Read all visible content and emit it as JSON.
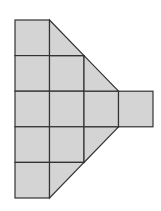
{
  "diagram": {
    "fill_color": "#d4d4d4",
    "stroke_color": "#333333",
    "background": "#ffffff",
    "grid": {
      "x": [
        15,
        49.5,
        84,
        118.5,
        153
      ],
      "y": [
        20,
        55.6,
        91.2,
        126.8,
        162.4,
        198
      ]
    },
    "full_squares": [
      {
        "col": 0,
        "row": 0
      },
      {
        "col": 0,
        "row": 1
      },
      {
        "col": 0,
        "row": 2
      },
      {
        "col": 0,
        "row": 3
      },
      {
        "col": 0,
        "row": 4
      },
      {
        "col": 1,
        "row": 1
      },
      {
        "col": 1,
        "row": 2
      },
      {
        "col": 1,
        "row": 3
      },
      {
        "col": 2,
        "row": 2
      },
      {
        "col": 3,
        "row": 2
      }
    ],
    "half_triangles": [
      {
        "col": 1,
        "row": 0,
        "orientation": "upper-right-diagonal"
      },
      {
        "col": 2,
        "row": 1,
        "orientation": "upper-right-diagonal"
      },
      {
        "col": 2,
        "row": 3,
        "orientation": "lower-right-diagonal"
      },
      {
        "col": 1,
        "row": 4,
        "orientation": "lower-right-diagonal"
      }
    ]
  }
}
